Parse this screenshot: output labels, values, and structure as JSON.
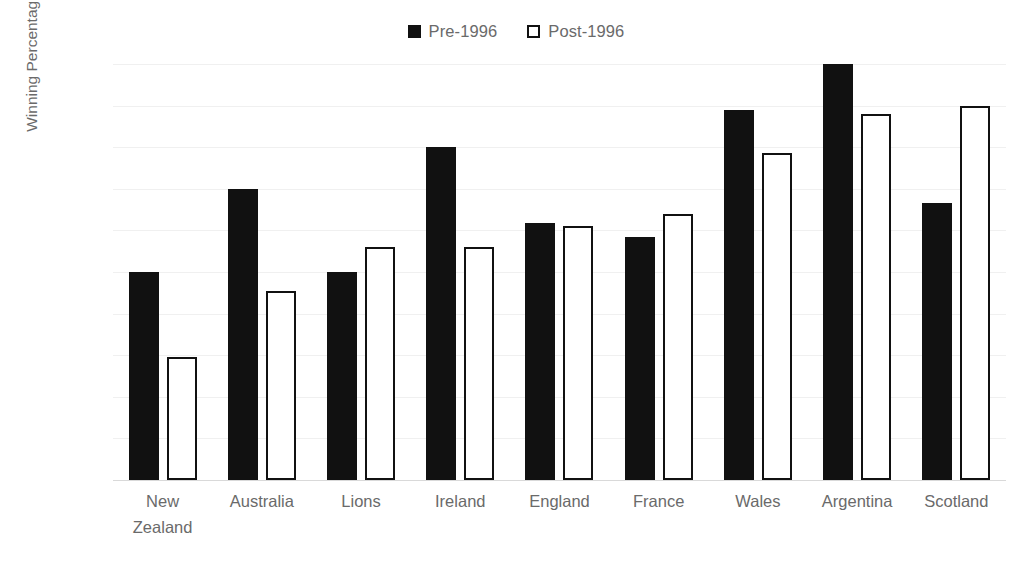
{
  "chart_data": {
    "type": "bar",
    "title": "",
    "subtitle": "",
    "xlabel": "",
    "ylabel": "Winning Percentage",
    "ylim": [
      0,
      100
    ],
    "ytick_labels": [
      "100%",
      "90%",
      "80%",
      "70%",
      "60%",
      "50%",
      "40%",
      "30%",
      "20%",
      "10%",
      "0%"
    ],
    "ytick_values": [
      100,
      90,
      80,
      70,
      60,
      50,
      40,
      30,
      20,
      10,
      0
    ],
    "grid": true,
    "grid_axis": "y",
    "legend_position": "top-center",
    "categories": [
      "New\nZealand",
      "Australia",
      "Lions",
      "Ireland",
      "England",
      "France",
      "Wales",
      "Argentina",
      "Scotland"
    ],
    "series": [
      {
        "name": "Pre-1996",
        "style": "filled",
        "color": "#111111",
        "values": [
          50,
          70,
          50,
          80,
          61.8,
          58.5,
          89,
          100,
          66.5
        ]
      },
      {
        "name": "Post-1996",
        "style": "hollow",
        "color": "#ffffff",
        "border_color": "#111111",
        "values": [
          29.5,
          45.5,
          56,
          56,
          61,
          64,
          78.5,
          88,
          90
        ]
      }
    ]
  },
  "colors": {
    "background": "#ffffff",
    "gridline": "#f0f0f0",
    "baseline": "#d9d9d9",
    "text": "#6a6a6a",
    "series_pre": "#111111",
    "series_post_fill": "#ffffff",
    "series_post_border": "#111111"
  }
}
